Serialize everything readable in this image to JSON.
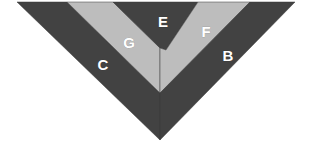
{
  "figure": {
    "background_color": "#ffffff",
    "width": 312,
    "height": 144
  },
  "palette": {
    "dark": "#424242",
    "light": "#bdbdbd",
    "label_text": "#ffffff",
    "outline": "#3a3a3a"
  },
  "chart_data": {
    "type": "diagram",
    "apex": {
      "x": 160,
      "y": 140
    },
    "top_left_tip": {
      "x": 17,
      "y": 2
    },
    "top_right_tip": {
      "x": 295,
      "y": 2
    },
    "bands": [
      {
        "id": "C",
        "label": "C",
        "tone": "dark",
        "color": "#424242",
        "order_from_outside": 1,
        "side": "left-outer",
        "label_position": {
          "x": 103,
          "y": 66
        }
      },
      {
        "id": "G",
        "label": "G",
        "tone": "light",
        "color": "#bdbdbd",
        "order_from_outside": 2,
        "side": "left-inner",
        "label_position": {
          "x": 129,
          "y": 44
        }
      },
      {
        "id": "E",
        "label": "E",
        "tone": "dark",
        "color": "#424242",
        "order_from_outside": 3,
        "side": "center",
        "label_position": {
          "x": 163,
          "y": 23
        }
      },
      {
        "id": "F",
        "label": "F",
        "tone": "light",
        "color": "#bdbdbd",
        "order_from_outside": 4,
        "side": "right-inner",
        "label_position": {
          "x": 206,
          "y": 33
        }
      },
      {
        "id": "B",
        "label": "B",
        "tone": "dark",
        "color": "#424242",
        "order_from_outside": 5,
        "side": "right-outer",
        "label_position": {
          "x": 228,
          "y": 57
        }
      }
    ],
    "legend": null,
    "grid": false,
    "axes": false
  }
}
